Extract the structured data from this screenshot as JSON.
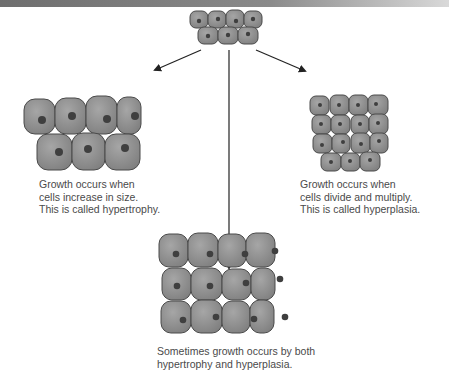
{
  "diagram": {
    "topic": "Cell growth: hypertrophy vs hyperplasia",
    "colors": {
      "cell_fill": "#8e8e8e",
      "cell_stroke": "#4a4a4a",
      "nucleus": "#3f3f3f",
      "arrow": "#222222",
      "text": "#4a4a4a"
    },
    "nodes": [
      {
        "id": "original-cells",
        "label": "Original cell cluster"
      },
      {
        "id": "hypertrophy",
        "caption": [
          "Growth occurs when",
          "cells increase in size.",
          "This is called hypertrophy."
        ]
      },
      {
        "id": "hyperplasia",
        "caption": [
          "Growth occurs when",
          "cells divide and multiply.",
          "This is called hyperplasia."
        ]
      },
      {
        "id": "both",
        "caption": [
          "Sometimes growth occurs by both",
          "hypertrophy and hyperplasia."
        ]
      }
    ],
    "edges": [
      {
        "from": "original-cells",
        "to": "hypertrophy"
      },
      {
        "from": "original-cells",
        "to": "hyperplasia"
      },
      {
        "from": "original-cells",
        "to": "both"
      }
    ]
  },
  "captions": {
    "hypertrophy": {
      "line1": "Growth occurs when",
      "line2": "cells increase in size.",
      "line3": "This is called hypertrophy."
    },
    "hyperplasia": {
      "line1": "Growth occurs when",
      "line2": "cells divide and multiply.",
      "line3": "This is called hyperplasia."
    },
    "both": {
      "line1": "Sometimes growth occurs by both",
      "line2": "hypertrophy and hyperplasia."
    }
  }
}
